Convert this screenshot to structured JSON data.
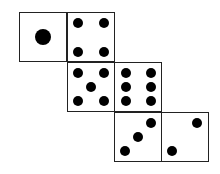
{
  "diagram": {
    "faces": [
      {
        "id": "face-1",
        "value": 1
      },
      {
        "id": "face-4",
        "value": 4
      },
      {
        "id": "face-5",
        "value": 5
      },
      {
        "id": "face-6",
        "value": 6
      },
      {
        "id": "face-3",
        "value": 3
      },
      {
        "id": "face-2",
        "value": 2
      }
    ],
    "colors": {
      "pip": "#000000",
      "border": "#222222",
      "background": "#ffffff"
    }
  }
}
